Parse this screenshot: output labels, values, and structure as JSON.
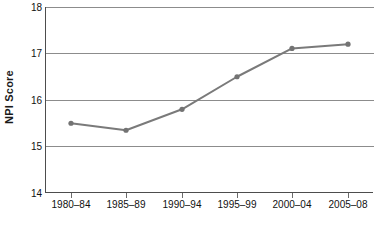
{
  "chart_data": {
    "type": "line",
    "title": "",
    "xlabel": "",
    "ylabel": "NPI Score",
    "categories": [
      "1980–84",
      "1985–89",
      "1990–94",
      "1995–99",
      "2000–04",
      "2005–08"
    ],
    "values": [
      15.5,
      15.35,
      15.8,
      16.5,
      17.11,
      17.2
    ],
    "series": [
      {
        "name": "NPI Score",
        "values": [
          15.5,
          15.35,
          15.8,
          16.5,
          17.11,
          17.2
        ]
      }
    ],
    "ylim": [
      14,
      18
    ],
    "yticks": [
      14,
      15,
      16,
      17,
      18
    ],
    "ytick_labels": [
      "14",
      "15",
      "16",
      "17",
      "18"
    ],
    "grid": true,
    "legend": false,
    "legend_position": "none",
    "line_color": "#7a7a7a",
    "marker_color": "#737373",
    "marker": "circle",
    "gridline_color": "#8c8c8c",
    "axis_color": "#4d4d4d",
    "background_color": "#ffffff"
  }
}
